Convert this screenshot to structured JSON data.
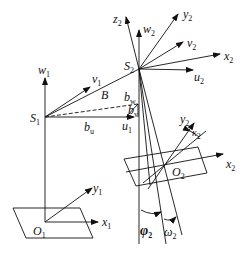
{
  "diagram": {
    "type": "coordinate-system-geometry",
    "stroke_color": "#111111",
    "points": {
      "S1": {
        "base": "S",
        "sub": "1"
      },
      "S2": {
        "base": "S",
        "sub": "2"
      },
      "O1": {
        "base": "O",
        "sub": "1"
      },
      "O2": {
        "base": "O",
        "sub": "2"
      }
    },
    "axes": {
      "w1": {
        "base": "w",
        "sub": "1"
      },
      "v1": {
        "base": "v",
        "sub": "1"
      },
      "u1": {
        "base": "u",
        "sub": "1"
      },
      "w2": {
        "base": "w",
        "sub": "2"
      },
      "z2": {
        "base": "z",
        "sub": "2"
      },
      "y2_top": {
        "base": "y",
        "sub": "2"
      },
      "v2": {
        "base": "v",
        "sub": "2"
      },
      "x2_top": {
        "base": "x",
        "sub": "2"
      },
      "u2": {
        "base": "u",
        "sub": "2"
      },
      "x1": {
        "base": "x",
        "sub": "1"
      },
      "y1": {
        "base": "y",
        "sub": "1"
      },
      "x2_plane": {
        "base": "x",
        "sub": "2"
      },
      "y2_plane": {
        "base": "y",
        "sub": "2"
      }
    },
    "baseline": {
      "B": {
        "base": "B",
        "sub": ""
      },
      "bu": {
        "base": "b",
        "sub": "u"
      },
      "bv": {
        "base": "b",
        "sub": "v"
      },
      "bw": {
        "base": "b",
        "sub": "w"
      }
    },
    "angles": {
      "phi2": {
        "base": "φ",
        "sub": "2"
      },
      "omega2": {
        "base": "ω",
        "sub": "2"
      },
      "kappa2": {
        "base": "κ",
        "sub": "2"
      }
    }
  }
}
